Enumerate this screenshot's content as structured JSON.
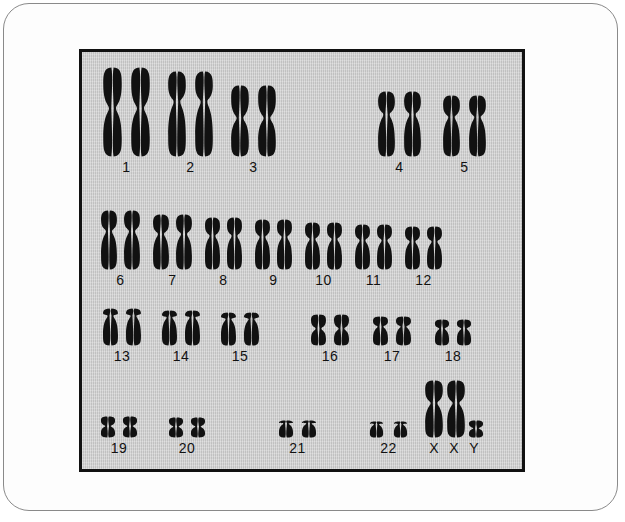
{
  "image": {
    "subject": "human-karyotype",
    "panel_background_color": "#c9c9c9",
    "chromosome_color": "#111111",
    "frame_color": "#8a8a8a",
    "label_color": "#111111"
  },
  "karyotype": {
    "rows": [
      {
        "row_id": "row-a-b",
        "groups": [
          {
            "label": "1",
            "count": 2,
            "shape": "metacentric",
            "height": 92,
            "width": 21,
            "gap": 7
          },
          {
            "label": "2",
            "count": 2,
            "shape": "submetacentric",
            "height": 88,
            "width": 20,
            "gap": 7
          },
          {
            "label": "3",
            "count": 2,
            "shape": "metacentric",
            "height": 74,
            "width": 20,
            "gap": 7
          },
          {
            "label": "4",
            "count": 2,
            "shape": "submetacentric",
            "height": 68,
            "width": 19,
            "gap": 7
          },
          {
            "label": "5",
            "count": 2,
            "shape": "submetacentric",
            "height": 64,
            "width": 19,
            "gap": 7
          }
        ]
      },
      {
        "row_id": "row-c",
        "groups": [
          {
            "label": "6",
            "count": 2,
            "shape": "submetacentric",
            "height": 62,
            "width": 18,
            "gap": 5
          },
          {
            "label": "7",
            "count": 2,
            "shape": "submetacentric",
            "height": 58,
            "width": 18,
            "gap": 5
          },
          {
            "label": "8",
            "count": 2,
            "shape": "submetacentric",
            "height": 55,
            "width": 17,
            "gap": 5
          },
          {
            "label": "9",
            "count": 2,
            "shape": "submetacentric",
            "height": 53,
            "width": 17,
            "gap": 5
          },
          {
            "label": "10",
            "count": 2,
            "shape": "submetacentric",
            "height": 50,
            "width": 17,
            "gap": 5
          },
          {
            "label": "11",
            "count": 2,
            "shape": "submetacentric",
            "height": 48,
            "width": 17,
            "gap": 5
          },
          {
            "label": "12",
            "count": 2,
            "shape": "submetacentric",
            "height": 46,
            "width": 17,
            "gap": 5
          }
        ]
      },
      {
        "row_id": "row-d-e",
        "groups": [
          {
            "label": "13",
            "count": 2,
            "shape": "acrocentric",
            "height": 40,
            "width": 17,
            "gap": 6
          },
          {
            "label": "14",
            "count": 2,
            "shape": "acrocentric",
            "height": 38,
            "width": 17,
            "gap": 6
          },
          {
            "label": "15",
            "count": 2,
            "shape": "acrocentric",
            "height": 36,
            "width": 17,
            "gap": 6
          },
          {
            "label": "16",
            "count": 2,
            "shape": "metacentric",
            "height": 34,
            "width": 17,
            "gap": 6
          },
          {
            "label": "17",
            "count": 2,
            "shape": "submetacentric",
            "height": 32,
            "width": 17,
            "gap": 6
          },
          {
            "label": "18",
            "count": 2,
            "shape": "submetacentric",
            "height": 29,
            "width": 16,
            "gap": 6
          }
        ]
      },
      {
        "row_id": "row-f-g-sex",
        "groups": [
          {
            "label": "19",
            "count": 2,
            "shape": "metacentric",
            "height": 24,
            "width": 16,
            "gap": 6
          },
          {
            "label": "20",
            "count": 2,
            "shape": "metacentric",
            "height": 23,
            "width": 16,
            "gap": 6
          },
          {
            "label": "21",
            "count": 2,
            "shape": "acrocentric",
            "height": 20,
            "width": 16,
            "gap": 7
          },
          {
            "label": "22",
            "count": 2,
            "shape": "acrocentric",
            "height": 19,
            "width": 15,
            "gap": 9
          },
          {
            "label": "X X Y",
            "count": 3,
            "shape": "sex",
            "height": 60,
            "width": 20,
            "gap": 2
          }
        ]
      }
    ],
    "sex_chromosome_labels": [
      "X",
      "X",
      "Y"
    ],
    "total_chromosomes": 47,
    "row_labels_row1": [
      "1",
      "2",
      "3",
      "4",
      "5"
    ],
    "row_labels_row2": [
      "6",
      "7",
      "8",
      "9",
      "10",
      "11",
      "12"
    ],
    "row_labels_row3": [
      "13",
      "14",
      "15",
      "16",
      "17",
      "18"
    ],
    "row_labels_row4": [
      "19",
      "20",
      "21",
      "22",
      "X",
      "X",
      "Y"
    ]
  }
}
